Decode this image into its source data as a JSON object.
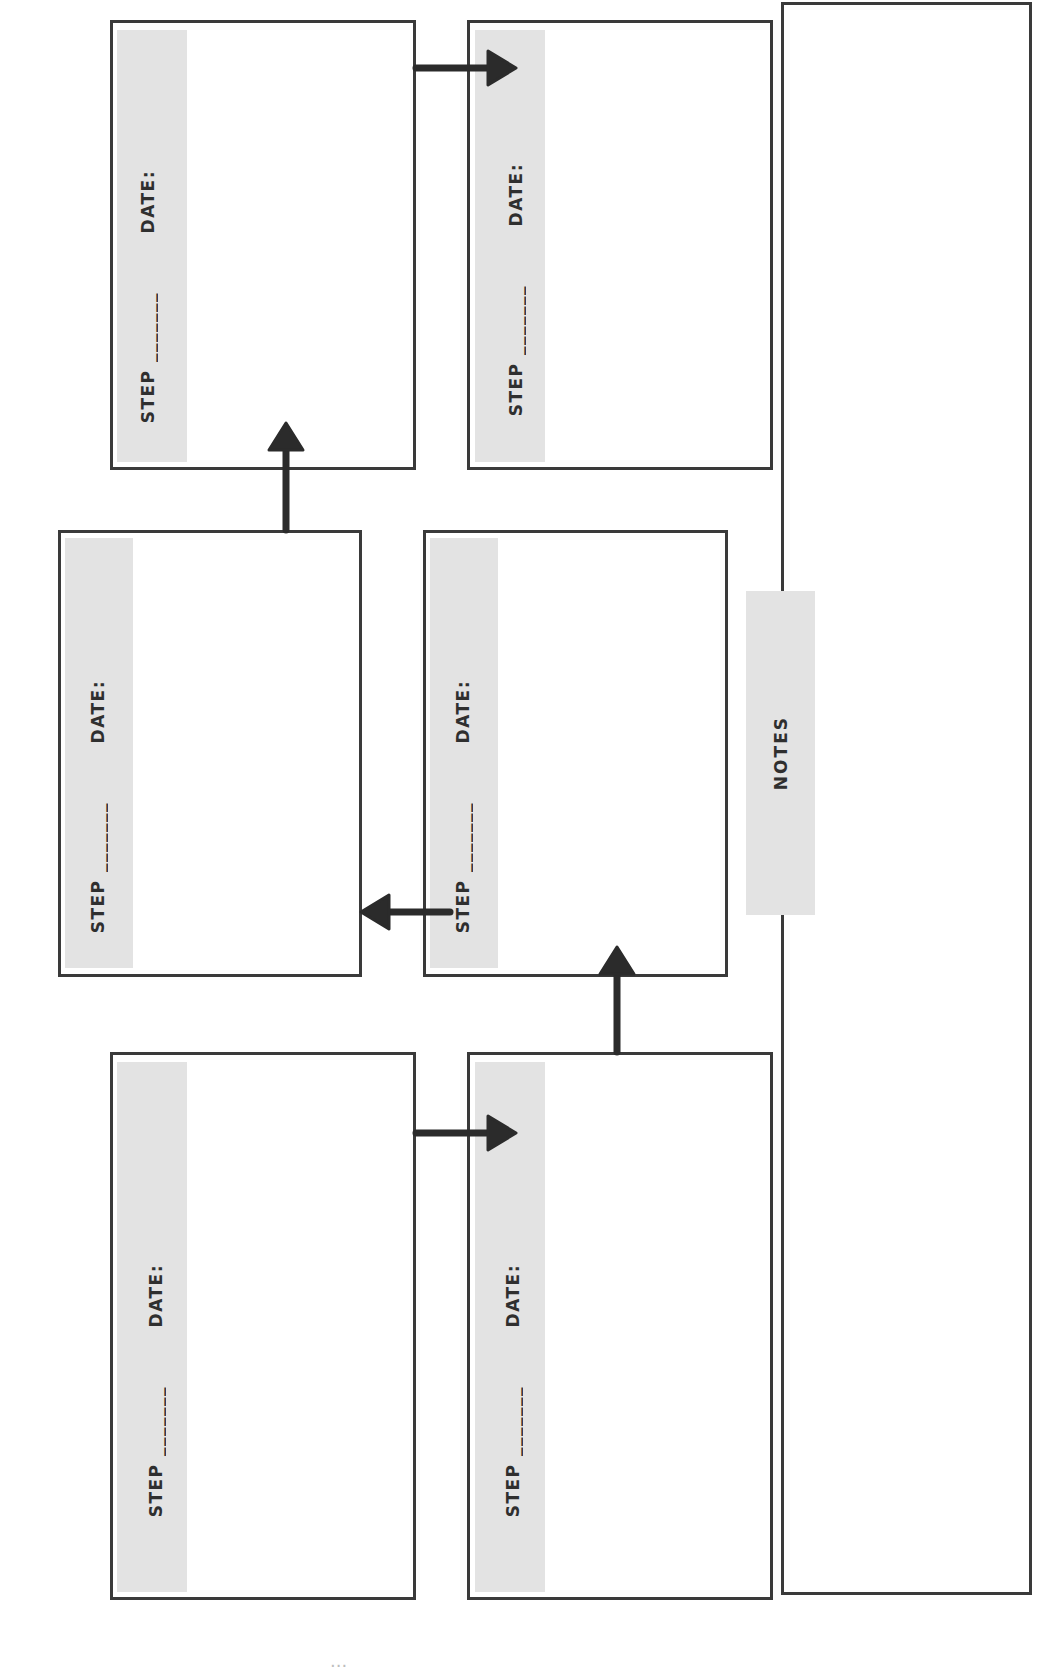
{
  "worksheet": {
    "orientation": "rotated-90-ccw",
    "step_boxes": [
      {
        "id": "A",
        "position": "top-left",
        "step_label": "STEP _______",
        "date_label": "DATE:"
      },
      {
        "id": "B",
        "position": "top-right",
        "step_label": "STEP _______",
        "date_label": "DATE:"
      },
      {
        "id": "C",
        "position": "middle-left",
        "step_label": "STEP _______",
        "date_label": "DATE:"
      },
      {
        "id": "D",
        "position": "middle-right",
        "step_label": "STEP _______",
        "date_label": "DATE:"
      },
      {
        "id": "E",
        "position": "bottom-left",
        "step_label": "STEP _______",
        "date_label": "DATE:"
      },
      {
        "id": "F",
        "position": "bottom-right",
        "step_label": "STEP _______",
        "date_label": "DATE:"
      }
    ],
    "notes": {
      "label": "NOTES"
    },
    "flow_arrows": [
      {
        "from": "E",
        "to": "F",
        "direction": "right"
      },
      {
        "from": "F",
        "to": "D",
        "direction": "up"
      },
      {
        "from": "D",
        "to": "C",
        "direction": "left"
      },
      {
        "from": "C",
        "to": "A",
        "direction": "up"
      },
      {
        "from": "A",
        "to": "B",
        "direction": "right"
      }
    ],
    "page_number_fragment": "..."
  },
  "colors": {
    "border": "#3a3a3a",
    "label_strip": "#e3e3e3",
    "text": "#2f2f2f",
    "arrow": "#2b2b2b"
  }
}
